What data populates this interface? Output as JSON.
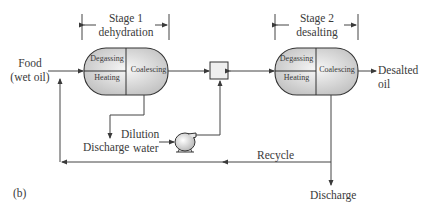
{
  "stage1": {
    "title": "Stage 1",
    "subtitle": "dehydration"
  },
  "stage2": {
    "title": "Stage 2",
    "subtitle": "desalting"
  },
  "vessel1": {
    "degassing": "Degassing",
    "heating": "Heating",
    "coalescing": "Coalescing"
  },
  "vessel2": {
    "degassing": "Degassing",
    "heating": "Heating",
    "coalescing": "Coalescing"
  },
  "feed": {
    "line1": "Food",
    "line2": "(wet oil)"
  },
  "product": {
    "line1": "Desalted",
    "line2": "oil"
  },
  "discharge1": "Discharge",
  "discharge2": "Discharge",
  "dilution": {
    "line1": "Dilution",
    "line2": "water"
  },
  "recycle": "Recycle",
  "panel_label": "(b)",
  "colors": {
    "line": "#4a4a4a",
    "vessel_fill": "#d9d9d9",
    "vessel_highlight": "#f4f4f4"
  }
}
